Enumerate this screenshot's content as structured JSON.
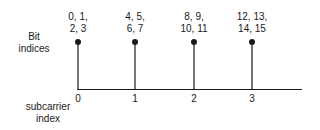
{
  "diagram": {
    "y_label_lines": [
      "Bit",
      "indices"
    ],
    "x_label_lines": [
      "subcarrier",
      "index"
    ],
    "subcarriers": [
      {
        "index": "0",
        "bits_line1": "0, 1,",
        "bits_line2": "2, 3"
      },
      {
        "index": "1",
        "bits_line1": "4, 5,",
        "bits_line2": "6, 7"
      },
      {
        "index": "2",
        "bits_line1": "8, 9,",
        "bits_line2": "10, 11"
      },
      {
        "index": "3",
        "bits_line1": "12, 13,",
        "bits_line2": "14, 15"
      }
    ]
  }
}
